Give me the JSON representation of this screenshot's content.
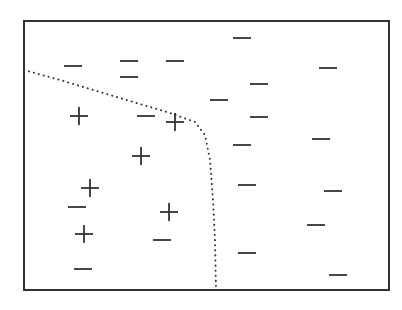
{
  "diagram": {
    "title": "Classification with nonlinear decision boundary",
    "frame": {
      "x": 24,
      "y": 21,
      "width": 365,
      "height": 269,
      "color": "#333333"
    },
    "boundary": {
      "style": "dotted",
      "color": "#333333",
      "points": [
        [
          24,
          70
        ],
        [
          60,
          80
        ],
        [
          100,
          92
        ],
        [
          140,
          104
        ],
        [
          170,
          113
        ],
        [
          195,
          122
        ],
        [
          205,
          135
        ],
        [
          210,
          160
        ],
        [
          213,
          200
        ],
        [
          215,
          240
        ],
        [
          216,
          290
        ]
      ]
    },
    "positive_points": [
      {
        "x": 79,
        "y": 116
      },
      {
        "x": 175,
        "y": 122
      },
      {
        "x": 141,
        "y": 156
      },
      {
        "x": 90,
        "y": 188
      },
      {
        "x": 169,
        "y": 212
      },
      {
        "x": 84,
        "y": 234
      }
    ],
    "negative_points": [
      {
        "x": 242,
        "y": 38
      },
      {
        "x": 73,
        "y": 66
      },
      {
        "x": 129,
        "y": 61
      },
      {
        "x": 175,
        "y": 61
      },
      {
        "x": 129,
        "y": 77
      },
      {
        "x": 328,
        "y": 68
      },
      {
        "x": 259,
        "y": 84
      },
      {
        "x": 219,
        "y": 100
      },
      {
        "x": 146,
        "y": 116
      },
      {
        "x": 259,
        "y": 117
      },
      {
        "x": 321,
        "y": 139
      },
      {
        "x": 242,
        "y": 145
      },
      {
        "x": 247,
        "y": 185
      },
      {
        "x": 333,
        "y": 191
      },
      {
        "x": 77,
        "y": 207
      },
      {
        "x": 316,
        "y": 225
      },
      {
        "x": 162,
        "y": 240
      },
      {
        "x": 247,
        "y": 253
      },
      {
        "x": 83,
        "y": 269
      },
      {
        "x": 338,
        "y": 275
      }
    ],
    "marks": {
      "positive_symbol": "+",
      "negative_symbol": "−",
      "color": "#333333",
      "size": 9
    }
  }
}
